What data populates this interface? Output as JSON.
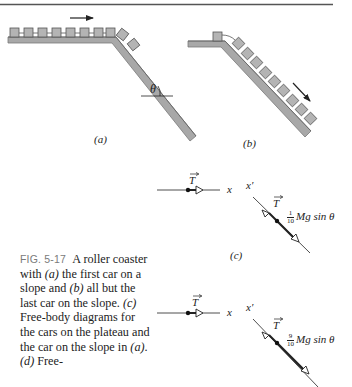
{
  "figure": {
    "number_label": "FIG. 5-17",
    "caption_parts": [
      "A roller coaster with ",
      "(a)",
      " the first car on a slope and ",
      "(b)",
      " all but the last car on the slope. ",
      "(c)",
      " Free-body diagrams for the cars on the plateau and the car on the slope in ",
      "(a)",
      ". ",
      "(d)",
      " Free-"
    ],
    "panels": {
      "a": {
        "label": "(a)",
        "angle_symbol": "θ",
        "cars_on_plateau": 8,
        "cars_on_slope": 2
      },
      "b": {
        "label": "(b)",
        "cars_on_plateau": 1,
        "cars_on_slope": 9
      },
      "c": {
        "label": "(c)",
        "plateau_axis": "x",
        "plateau_force": "T",
        "slope_axis": "x′",
        "slope_tension": "T",
        "gravity_frac_num": "1",
        "gravity_frac_den": "10",
        "gravity_tail": "Mg sin θ"
      },
      "d": {
        "plateau_axis": "x",
        "plateau_force": "T",
        "slope_axis": "x′",
        "slope_tension": "T",
        "gravity_frac_num": "9",
        "gravity_frac_den": "10",
        "gravity_tail": "Mg sin θ"
      }
    },
    "colors": {
      "track": "#a8a8a8",
      "track_edge": "#6e6e6e",
      "car_fill": "#b4b4b4",
      "car_edge": "#555555",
      "ink": "#222222",
      "caption_label": "#7a7a7a"
    }
  }
}
